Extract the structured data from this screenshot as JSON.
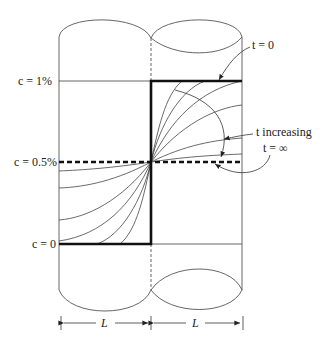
{
  "figure": {
    "type": "diffusion-couple-diagram",
    "labels": {
      "c_high": "c = 1%",
      "c_mid": "c = 0.5%",
      "c_low": "c = 0",
      "t_zero": "t = 0",
      "t_increasing": "t increasing",
      "t_infinity": "t = ∞",
      "length_left": "L",
      "length_right": "L"
    },
    "colors": {
      "ink": "#222222",
      "thin_line": "#555555",
      "background": "#ffffff"
    }
  }
}
